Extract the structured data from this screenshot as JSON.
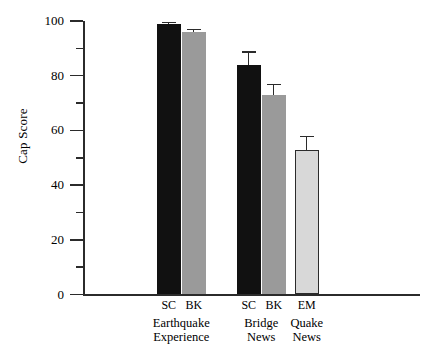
{
  "chart_data": {
    "type": "bar",
    "title": "",
    "xlabel": "",
    "ylabel": "Cap Score",
    "ylim": [
      0,
      100
    ],
    "yticks": [
      0,
      20,
      40,
      60,
      80,
      100
    ],
    "ytick_labels": [
      "0",
      "20",
      "40",
      "60",
      "80",
      "100"
    ],
    "yminor_ticks": [
      10,
      30,
      50,
      70,
      90
    ],
    "grid": false,
    "legend": "none",
    "groups": [
      {
        "name": "Earthquake Experience",
        "label_lines": [
          "Earthquake",
          "Experience"
        ],
        "bars": [
          {
            "series": "SC",
            "value": 99,
            "error": 0.8,
            "fill": "#111111",
            "outline": false
          },
          {
            "series": "BK",
            "value": 96,
            "error": 1.2,
            "fill": "#9a9a9a",
            "outline": false
          }
        ]
      },
      {
        "name": "Bridge News",
        "label_lines": [
          "Bridge",
          "News"
        ],
        "bars": [
          {
            "series": "SC",
            "value": 84,
            "error": 5.0,
            "fill": "#111111",
            "outline": false
          },
          {
            "series": "BK",
            "value": 73,
            "error": 4.0,
            "fill": "#9a9a9a",
            "outline": false
          }
        ]
      },
      {
        "name": "Quake News",
        "label_lines": [
          "Quake",
          "News"
        ],
        "bars": [
          {
            "series": "EM",
            "value": 53,
            "error": 5.0,
            "fill": "#d8d8d8",
            "outline": true
          }
        ]
      }
    ],
    "colors": {
      "sc_fill": "#111111",
      "bk_fill": "#9a9a9a",
      "em_fill": "#d8d8d8",
      "axis": "#2b2b2b",
      "background": "#ffffff"
    }
  }
}
